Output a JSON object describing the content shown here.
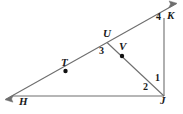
{
  "figure": {
    "type": "geometry-diagram",
    "width": 183,
    "height": 114,
    "background_color": "#ffffff",
    "line_color": "#6e6e6e",
    "label_color": "#1a1a1a",
    "dot_color": "#111111"
  },
  "point_labels": [
    {
      "id": "K",
      "text": "K",
      "x": 167,
      "y": 10
    },
    {
      "id": "U",
      "text": "U",
      "x": 103,
      "y": 28
    },
    {
      "id": "V",
      "text": "V",
      "x": 119,
      "y": 41
    },
    {
      "id": "T",
      "text": "T",
      "x": 61,
      "y": 57
    },
    {
      "id": "J",
      "text": "J",
      "x": 160,
      "y": 95
    },
    {
      "id": "H",
      "text": "H",
      "x": 19,
      "y": 96
    }
  ],
  "angle_labels": [
    {
      "id": "angle-4",
      "text": "4",
      "x": 156,
      "y": 12
    },
    {
      "id": "angle-3",
      "text": "3",
      "x": 99,
      "y": 46
    },
    {
      "id": "angle-1",
      "text": "1",
      "x": 155,
      "y": 73
    },
    {
      "id": "angle-2",
      "text": "2",
      "x": 143,
      "y": 82
    }
  ],
  "dots": [
    {
      "id": "dot-T",
      "x": 65.5,
      "y": 71.0,
      "r": 2.2
    },
    {
      "id": "dot-V",
      "x": 122.0,
      "y": 56.0,
      "r": 2.2
    }
  ],
  "segments": [
    {
      "id": "ray-HK",
      "x1": 5.5,
      "y1": 99.5,
      "x2": 176.5,
      "y2": 3.5
    },
    {
      "id": "segment-HJ",
      "x1": 12.0,
      "y1": 96.0,
      "x2": 164.0,
      "y2": 96.0
    },
    {
      "id": "segment-KJ",
      "x1": 164.0,
      "y1": 18.0,
      "x2": 164.0,
      "y2": 96.0
    },
    {
      "id": "segment-UJ",
      "x1": 107.0,
      "y1": 42.5,
      "x2": 164.0,
      "y2": 96.0
    }
  ],
  "arrowheads": [
    {
      "id": "arrow-lower-left",
      "x": 5.5,
      "y": 99.5,
      "angle_deg": 150.7
    },
    {
      "id": "arrow-upper-right",
      "x": 176.5,
      "y": 3.5,
      "angle_deg": -29.3
    }
  ]
}
